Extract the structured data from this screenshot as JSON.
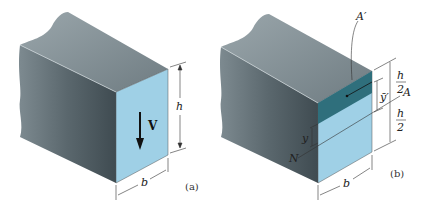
{
  "figure_a": {
    "caption": "(a)",
    "force_label": "V",
    "height_label": "h",
    "width_label": "b"
  },
  "figure_b": {
    "caption": "(b)",
    "area_top_label": "A′",
    "centroid_label": "ȳ′",
    "half_height_top_num": "h",
    "half_height_top_den": "2",
    "half_height_bottom_num": "h",
    "half_height_bottom_den": "2",
    "neutral_axis_label": "A",
    "neutral_axis_end_label": "N",
    "y_label": "y",
    "width_label": "b"
  },
  "colors": {
    "face_light_blue": "#9fd0e6",
    "face_dark_teal": "#2f6f7c",
    "body_gray_top": "#8a969c",
    "body_gray_side": "#5d6a70",
    "line": "#333333"
  }
}
